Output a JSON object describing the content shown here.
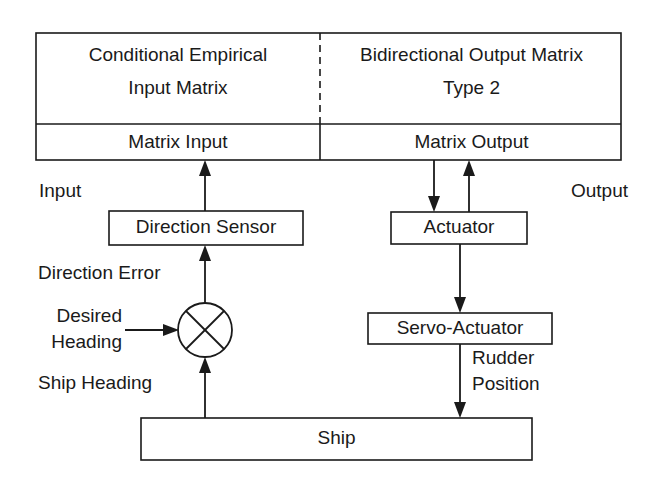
{
  "diagram": {
    "stroke_color": "#1a1a1a",
    "background_color": "#ffffff",
    "matrix_panel": {
      "left_cell": {
        "line1": "Conditional Empirical",
        "line2": "Input Matrix",
        "footer": "Matrix Input"
      },
      "right_cell": {
        "line1": "Bidirectional Output Matrix",
        "line2": "Type 2",
        "footer": "Matrix Output"
      },
      "divider_style": "dashed"
    },
    "side_labels": {
      "input": "Input",
      "output": "Output"
    },
    "blocks": [
      {
        "id": "direction-sensor",
        "label": "Direction Sensor"
      },
      {
        "id": "actuator",
        "label": "Actuator"
      },
      {
        "id": "servo-actuator",
        "label": "Servo-Actuator"
      },
      {
        "id": "ship",
        "label": "Ship"
      }
    ],
    "summing_junction": {
      "id": "summing-junction",
      "symbol": "cross-circle"
    },
    "signal_labels": {
      "direction_error": "Direction Error",
      "desired_heading_line1": "Desired",
      "desired_heading_line2": "Heading",
      "ship_heading": "Ship Heading",
      "rudder_position_line1": "Rudder",
      "rudder_position_line2": "Position"
    }
  }
}
